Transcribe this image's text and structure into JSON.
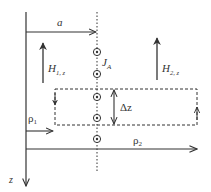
{
  "diagram": {
    "labels": {
      "a": "a",
      "z": "z",
      "h1_main": "H",
      "h1_sub": "1, z",
      "h2_main": "H",
      "h2_sub": "2, z",
      "j_main": "J",
      "j_sub": "A",
      "delta_z": "Δz",
      "rho1_main": "ρ",
      "rho1_sub": "1",
      "rho2_main": "ρ",
      "rho2_sub": "2"
    },
    "current_elements_count": 5,
    "colors": {
      "stroke": "#333333",
      "background": "#ffffff"
    }
  }
}
